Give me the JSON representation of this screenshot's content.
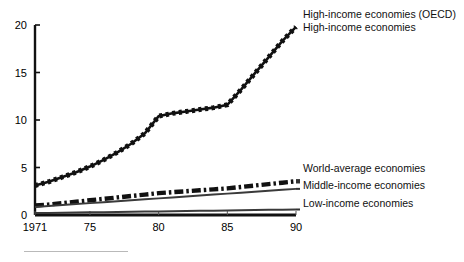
{
  "chart_data": {
    "type": "line",
    "title": "",
    "subtitle": "",
    "xlabel": "",
    "ylabel": "",
    "xlim": [
      1971,
      1990
    ],
    "ylim": [
      0,
      20
    ],
    "grid": false,
    "legend_position": "right-inline",
    "x_tick_labels": [
      "1971",
      "75",
      "80",
      "85",
      "90"
    ],
    "x_tick_values": [
      1971,
      1975,
      1980,
      1985,
      1990
    ],
    "y_tick_labels": [
      "0",
      "5",
      "10",
      "15",
      "20"
    ],
    "y_tick_values": [
      0,
      5,
      10,
      15,
      20
    ],
    "x": [
      1971,
      1972,
      1973,
      1974,
      1975,
      1976,
      1977,
      1978,
      1979,
      1980,
      1981,
      1982,
      1983,
      1984,
      1985,
      1986,
      1987,
      1988,
      1989,
      1990
    ],
    "series": [
      {
        "name": "High-income economies (OECD)",
        "style": "dotted-thick",
        "color": "#111111",
        "values": [
          3.1,
          3.5,
          4.0,
          4.5,
          5.1,
          5.8,
          6.6,
          7.5,
          8.6,
          10.4,
          10.7,
          10.9,
          11.1,
          11.3,
          11.6,
          13.2,
          14.9,
          16.6,
          18.3,
          19.8
        ]
      },
      {
        "name": "World-average economies",
        "style": "dash-dot",
        "color": "#111111",
        "values": [
          1.0,
          1.1,
          1.25,
          1.4,
          1.55,
          1.7,
          1.85,
          2.0,
          2.15,
          2.3,
          2.4,
          2.5,
          2.6,
          2.7,
          2.8,
          2.95,
          3.1,
          3.25,
          3.4,
          3.55
        ]
      },
      {
        "name": "Middle-income economies",
        "style": "solid-thin",
        "color": "#3a3a3a",
        "values": [
          0.85,
          0.95,
          1.05,
          1.15,
          1.25,
          1.35,
          1.45,
          1.55,
          1.65,
          1.75,
          1.85,
          1.95,
          2.05,
          2.15,
          2.25,
          2.35,
          2.45,
          2.55,
          2.65,
          2.75
        ]
      },
      {
        "name": "Low-income economies",
        "style": "solid-thin",
        "color": "#3a3a3a",
        "values": [
          0.2,
          0.22,
          0.24,
          0.26,
          0.28,
          0.3,
          0.32,
          0.34,
          0.36,
          0.38,
          0.4,
          0.42,
          0.44,
          0.46,
          0.48,
          0.5,
          0.52,
          0.54,
          0.56,
          0.58
        ]
      }
    ]
  },
  "legend": {
    "high_income_oecd": "High-income economies (OECD)",
    "high_income": "High-income economies",
    "world_average": "World-average economies",
    "middle_income": "Middle-income economies",
    "low_income": "Low-income economies"
  },
  "axis": {
    "y_ticks": [
      "20",
      "15",
      "10",
      "5",
      "0"
    ],
    "x_ticks": [
      "1971",
      "75",
      "80",
      "85",
      "90"
    ]
  }
}
